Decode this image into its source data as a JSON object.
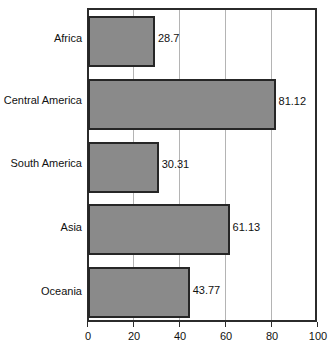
{
  "chart_data": {
    "type": "bar",
    "orientation": "horizontal",
    "title": "",
    "xlabel": "",
    "ylabel": "",
    "xlim": [
      0,
      100
    ],
    "xticks": [
      0,
      20,
      40,
      60,
      80,
      100
    ],
    "xtick_labels": [
      "0",
      "20",
      "40",
      "60",
      "80",
      "100"
    ],
    "gridlines": [
      20,
      40,
      60,
      80
    ],
    "grid": true,
    "legend": null,
    "categories": [
      "Africa",
      "Central America",
      "South America",
      "Asia",
      "Oceania"
    ],
    "values": [
      28.7,
      81.12,
      30.31,
      61.13,
      43.77
    ],
    "value_labels": [
      "28.7",
      "81.12",
      "30.31",
      "61.13",
      "43.77"
    ],
    "bar_fill_color": "#8a8a8a",
    "bar_border_color": "#262626",
    "axis_color": "#2b2b2b",
    "gridline_color": "#b4b4b4",
    "background_color": "#ffffff"
  }
}
